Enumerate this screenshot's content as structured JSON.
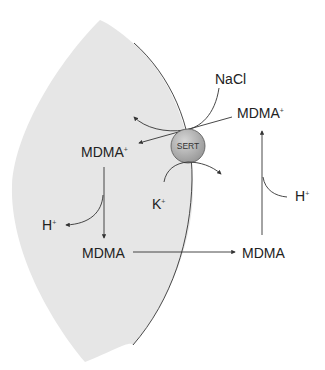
{
  "diagram": {
    "transporter": "SERT",
    "labels": {
      "nacl": "NaCl",
      "mdma_plus_out": "MDMA",
      "mdma_plus_out_charge": "+",
      "mdma_plus_in": "MDMA",
      "mdma_plus_in_charge": "+",
      "h_in": "H",
      "h_in_charge": "+",
      "k_in": "K",
      "k_in_charge": "+",
      "mdma_in": "MDMA",
      "mdma_out": "MDMA",
      "h_out": "H",
      "h_out_charge": "+"
    },
    "colors": {
      "cell_fill": "#e6e6e6",
      "sert_fill": "#b5b5b5",
      "line": "#333333"
    }
  }
}
